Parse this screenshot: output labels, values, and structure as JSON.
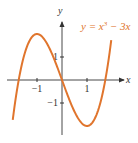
{
  "chart_data": {
    "type": "line",
    "title": "",
    "equation": "y = x³ − 3x",
    "equation_parts": {
      "lhs": "y = x",
      "exp": "3",
      "rhs": " − 3x"
    },
    "xlabel": "x",
    "ylabel": "y",
    "xlim": [
      -2.2,
      2.3
    ],
    "ylim": [
      -2.6,
      2.6
    ],
    "x_ticks": [
      {
        "value": -1,
        "label": "−1"
      },
      {
        "value": 1,
        "label": "1"
      }
    ],
    "y_ticks": [
      {
        "value": 1,
        "label": "1"
      },
      {
        "value": -1,
        "label": "−1"
      }
    ],
    "series": [
      {
        "name": "y = x^3 - 3x",
        "function": "x^3 - 3x",
        "domain": [
          -1.97,
          1.97
        ],
        "color": "#e0752d"
      }
    ],
    "grid": false,
    "legend": "none"
  }
}
